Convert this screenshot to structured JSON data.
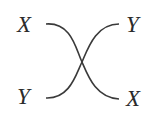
{
  "diagram": {
    "type": "crossover",
    "labels": {
      "top_left": "X",
      "top_right": "Y",
      "bottom_left": "Y",
      "bottom_right": "X"
    },
    "line_color": "#3a3a3a",
    "text_color": "#2b2b2b"
  }
}
